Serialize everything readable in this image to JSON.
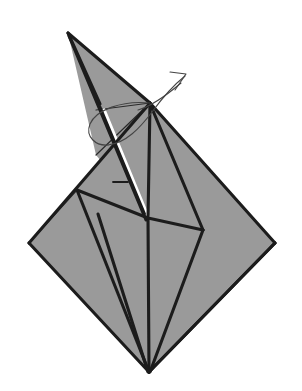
{
  "diagram": {
    "background_color": "#ffffff",
    "paper": {
      "fill_color": "#9a9a9a",
      "edge_color": "#1c1c1c",
      "crease_color": "#2a2a2a",
      "highlight_color": "#ffffff",
      "edge_width_px": 3.2,
      "crease_width_px": 1.3
    },
    "arrow": {
      "label": "rotate-swivel-arrow",
      "color": "#444444",
      "stroke_width_px": 1.1,
      "direction": "up-right",
      "style": "wrap-around-loop-with-open-arrowhead",
      "head_tip": [
        186,
        74
      ]
    },
    "canvas": {
      "width": 302,
      "height": 391
    },
    "vertices": {
      "spike_apex": [
        68,
        33
      ],
      "diamond_top": [
        150,
        103
      ],
      "diamond_left": [
        29,
        243
      ],
      "diamond_right": [
        275,
        243
      ],
      "diamond_bottom": [
        149,
        372
      ],
      "center_junction": [
        148,
        218
      ],
      "right_junction": [
        203,
        230
      ],
      "left_crease_junction": [
        77,
        190
      ],
      "flap_upper": [
        105,
        112
      ]
    },
    "shapes": [
      {
        "name": "left-lower-panel",
        "points": "29,243 150,103 148,218 149,372",
        "fill": "#9a9a9a"
      },
      {
        "name": "right-lower-panel",
        "points": "150,103 275,243 149,372 148,218",
        "fill": "#9a9a9a"
      },
      {
        "name": "upper-spike-panel",
        "points": "68,33 150,103 148,218 104,112",
        "fill": "#9a9a9a"
      }
    ],
    "creases": [
      {
        "name": "crease-left-fan-outer",
        "from": [
          29,
          243
        ],
        "to": [
          149,
          372
        ]
      },
      {
        "name": "crease-left-fan-inner",
        "from": [
          77,
          190
        ],
        "to": [
          149,
          372
        ]
      },
      {
        "name": "crease-right-fan-outer",
        "from": [
          275,
          243
        ],
        "to": [
          149,
          372
        ]
      },
      {
        "name": "crease-center-spine",
        "from": [
          148,
          218
        ],
        "to": [
          149,
          372
        ]
      },
      {
        "name": "crease-center-to-right-junction",
        "from": [
          148,
          218
        ],
        "to": [
          203,
          230
        ]
      },
      {
        "name": "crease-right-junction-to-top",
        "from": [
          203,
          230
        ],
        "to": [
          150,
          103
        ]
      },
      {
        "name": "crease-top-to-center",
        "from": [
          150,
          103
        ],
        "to": [
          148,
          218
        ]
      },
      {
        "name": "crease-left-flap-edge",
        "from": [
          105,
          112
        ],
        "to": [
          148,
          218
        ]
      },
      {
        "name": "crease-upper-left-band",
        "from": [
          68,
          33
        ],
        "to": [
          148,
          218
        ]
      },
      {
        "name": "crease-horizon-left",
        "from": [
          98,
          110
        ],
        "to": [
          150,
          103
        ]
      },
      {
        "name": "crease-left-side-fold",
        "from": [
          77,
          190
        ],
        "to": [
          29,
          243
        ]
      },
      {
        "name": "tick-mark-small",
        "from": [
          113,
          182
        ],
        "to": [
          128,
          182
        ]
      }
    ],
    "annotations": {
      "tick_label": "small reference tick",
      "flap_label": "raised white flap sliver"
    }
  }
}
